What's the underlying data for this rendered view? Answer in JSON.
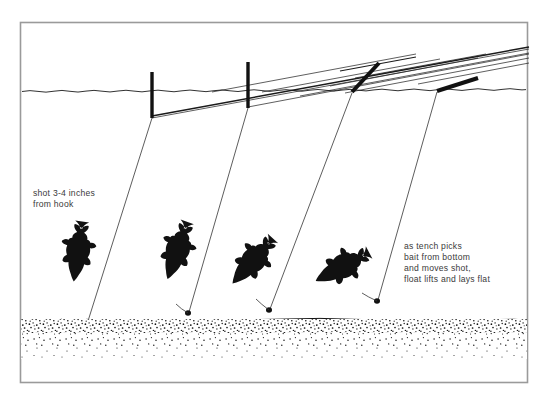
{
  "figure": {
    "background_color": "#ffffff",
    "ink_color": "#111111",
    "text_color": "#3a3a3a",
    "border_color": "#9a9a9a"
  },
  "annotations": {
    "left": {
      "lines": [
        "shot 3-4 inches",
        "from hook"
      ],
      "line1": "shot 3-4 inches",
      "line2": "from hook"
    },
    "right": {
      "lines": [
        "as tench picks",
        "bait from bottom",
        "and moves shot,",
        "float lifts and lays flat"
      ],
      "line1": "as tench picks",
      "line2": "bait from bottom",
      "line3": "and moves shot,",
      "line4": "float lifts and lays flat"
    }
  },
  "scene": {
    "water_surface_label": "waterline",
    "bed_label": "stippled lake bed",
    "stages": [
      {
        "index": 1,
        "float_angle_deg": 0,
        "float_state": "upright",
        "fish_angle_deg": 8,
        "fish_state": "head-down on bottom taking bait",
        "shot_state": "on bottom near hook"
      },
      {
        "index": 2,
        "float_angle_deg": 0,
        "float_state": "upright",
        "fish_angle_deg": 20,
        "fish_state": "lifting bait from bottom",
        "shot_state": "lifted just off bottom"
      },
      {
        "index": 3,
        "float_angle_deg": 48,
        "float_state": "tilting",
        "fish_angle_deg": 42,
        "fish_state": "moving away with bait",
        "shot_state": "raised"
      },
      {
        "index": 4,
        "float_angle_deg": 20,
        "float_state": "lying flat",
        "fish_angle_deg": 28,
        "fish_state": "swimming off with bait",
        "shot_state": "fully raised"
      }
    ]
  }
}
